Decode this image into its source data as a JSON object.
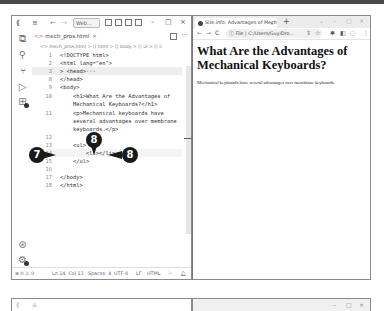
{
  "vscode": {
    "title_bar": {
      "logo_icon": "vscode-logo-icon",
      "menu_glyph": "≡",
      "back_glyph": "←",
      "forward_glyph": "→",
      "search_label": "Web...",
      "minimize": "–",
      "maximize": "□",
      "close": "×"
    },
    "activity_bar": [
      {
        "name": "explorer-icon",
        "glyph": "⧉"
      },
      {
        "name": "search-icon",
        "glyph": "⚲"
      },
      {
        "name": "source-control-icon",
        "glyph": "⑂"
      },
      {
        "name": "run-debug-icon",
        "glyph": "▷"
      },
      {
        "name": "extensions-icon",
        "glyph": "⊞"
      },
      {
        "name": "account-icon",
        "glyph": "⊛"
      },
      {
        "name": "manage-gear-icon",
        "glyph": "⚙"
      }
    ],
    "tab": {
      "label": "mech_pros.html",
      "close": "×",
      "file_icon": "<>"
    },
    "more_glyph": "···",
    "breadcrumb": "<> mech_pros.html > ⟨⟩ html > ⟨⟩ body > ⟨⟩ ul > ⟨⟩ li",
    "lines": [
      {
        "n": "1",
        "code": "<!DOCTYPE html>"
      },
      {
        "n": "2",
        "code": "<html lang=\"en\">"
      },
      {
        "n": "3",
        "code": "> <head>···"
      },
      {
        "n": "8",
        "code": "</head>"
      },
      {
        "n": "9",
        "code": "<body>"
      },
      {
        "n": "10",
        "code": "    <h1>What Are the Advantages of"
      },
      {
        "n": "",
        "code": "    Mechanical Keyboards?</h1>"
      },
      {
        "n": "11",
        "code": "    <p>Mechanical keyboards have"
      },
      {
        "n": "",
        "code": "    several advantages over membrane"
      },
      {
        "n": "",
        "code": "    keyboards.</p>"
      },
      {
        "n": "12",
        "code": ""
      },
      {
        "n": "13",
        "code": "    <ul>"
      },
      {
        "n": "14",
        "code": "        <li></li>"
      },
      {
        "n": "15",
        "code": "    </ul>"
      },
      {
        "n": "16",
        "code": ""
      },
      {
        "n": "17",
        "code": "</body>"
      },
      {
        "n": "18",
        "code": "</html>"
      }
    ],
    "callouts": {
      "left": "7",
      "top": "8",
      "right": "8"
    },
    "status_bar": {
      "problems": "⊗ 0 ⚠ 0",
      "position": "Ln 14, Col 13",
      "spaces": "Spaces: 4",
      "encoding": "UTF-8",
      "eol": "LF",
      "language": "HTML",
      "feedback_glyph": "⚐",
      "bell_glyph": "🔔︎"
    }
  },
  "browser": {
    "tab_title": "Site.info: Advantages of Mech...",
    "tab_close": "×",
    "new_tab": "+",
    "controls": {
      "chevron": "⌄",
      "minimize": "–",
      "maximize": "□",
      "close": "×"
    },
    "nav": {
      "back": "←",
      "forward": "→",
      "reload": "C"
    },
    "address": "ⓘ File | C:/Users/Guy/Dro...",
    "toolbar_icons": {
      "share": "⇪",
      "star": "☆",
      "extensions": "✱",
      "sidepanel": "◧",
      "profile": "◌",
      "menu": "⋮"
    },
    "page": {
      "heading": "What Are the Advantages of Mechanical Keyboards?",
      "paragraph": "Mechanical keyboards have several advantages over membrane keyboards."
    }
  }
}
